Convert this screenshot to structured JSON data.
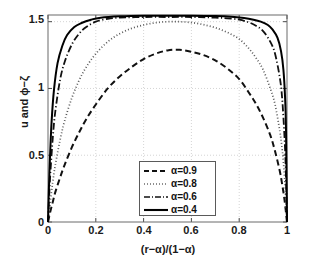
{
  "chart_data": {
    "type": "line",
    "title": "",
    "xlabel": "(r−α)/(1−α)",
    "ylabel": "u and ϕ−ζ",
    "xlim": [
      0,
      1
    ],
    "ylim": [
      0,
      1.55
    ],
    "grid": true,
    "xticks": [
      "0",
      "0.2",
      "0.4",
      "0.6",
      "0.8",
      "1"
    ],
    "xtick_values": [
      0,
      0.2,
      0.4,
      0.6,
      0.8,
      1
    ],
    "yticks": [
      "0",
      "0.5",
      "1",
      "1.5"
    ],
    "ytick_values": [
      0,
      0.5,
      1,
      1.5
    ],
    "legend_position": "lower center",
    "series": [
      {
        "name": "α=0.9",
        "style": "dashed",
        "color": "#111111",
        "peak": 1.29,
        "x": [
          0,
          0.01,
          0.02,
          0.03,
          0.05,
          0.07,
          0.1,
          0.13,
          0.16,
          0.2,
          0.25,
          0.3,
          0.35,
          0.4,
          0.45,
          0.5,
          0.55,
          0.6,
          0.65,
          0.7,
          0.75,
          0.8,
          0.84,
          0.87,
          0.9,
          0.93,
          0.95,
          0.97,
          0.98,
          0.99,
          1
        ],
        "y": [
          0,
          0.08,
          0.15,
          0.22,
          0.33,
          0.43,
          0.56,
          0.67,
          0.77,
          0.88,
          1.0,
          1.09,
          1.16,
          1.22,
          1.26,
          1.285,
          1.29,
          1.275,
          1.25,
          1.21,
          1.15,
          1.07,
          0.97,
          0.885,
          0.78,
          0.65,
          0.53,
          0.38,
          0.28,
          0.16,
          0
        ]
      },
      {
        "name": "α=0.8",
        "style": "dotted",
        "color": "#5a5a5a",
        "peak": 1.5,
        "x": [
          0,
          0.01,
          0.02,
          0.03,
          0.05,
          0.07,
          0.1,
          0.13,
          0.16,
          0.2,
          0.25,
          0.3,
          0.35,
          0.4,
          0.45,
          0.5,
          0.55,
          0.6,
          0.65,
          0.7,
          0.75,
          0.8,
          0.84,
          0.87,
          0.9,
          0.93,
          0.95,
          0.97,
          0.98,
          0.99,
          1
        ],
        "y": [
          0,
          0.16,
          0.3,
          0.42,
          0.61,
          0.76,
          0.93,
          1.06,
          1.16,
          1.26,
          1.35,
          1.41,
          1.45,
          1.475,
          1.492,
          1.5,
          1.5,
          1.493,
          1.478,
          1.455,
          1.42,
          1.37,
          1.3,
          1.23,
          1.14,
          1.0,
          0.88,
          0.68,
          0.54,
          0.33,
          0
        ]
      },
      {
        "name": "α=0.6",
        "style": "dashdot",
        "color": "#111111",
        "peak": 1.535,
        "x": [
          0,
          0.005,
          0.01,
          0.02,
          0.03,
          0.05,
          0.07,
          0.1,
          0.13,
          0.16,
          0.2,
          0.25,
          0.3,
          0.4,
          0.5,
          0.6,
          0.7,
          0.75,
          0.8,
          0.84,
          0.87,
          0.9,
          0.93,
          0.95,
          0.97,
          0.98,
          0.99,
          0.995,
          1
        ],
        "y": [
          0,
          0.2,
          0.37,
          0.63,
          0.82,
          1.06,
          1.2,
          1.33,
          1.41,
          1.46,
          1.5,
          1.522,
          1.53,
          1.535,
          1.535,
          1.535,
          1.53,
          1.525,
          1.515,
          1.495,
          1.47,
          1.43,
          1.35,
          1.26,
          1.08,
          0.92,
          0.62,
          0.38,
          0
        ]
      },
      {
        "name": "α=0.4",
        "style": "solid",
        "color": "#000000",
        "peak": 1.545,
        "x": [
          0,
          0.004,
          0.008,
          0.015,
          0.025,
          0.04,
          0.06,
          0.08,
          0.11,
          0.14,
          0.18,
          0.22,
          0.3,
          0.4,
          0.5,
          0.6,
          0.7,
          0.78,
          0.82,
          0.86,
          0.89,
          0.92,
          0.94,
          0.96,
          0.975,
          0.985,
          0.992,
          0.996,
          1
        ],
        "y": [
          0,
          0.26,
          0.47,
          0.75,
          0.99,
          1.19,
          1.32,
          1.4,
          1.46,
          1.49,
          1.515,
          1.53,
          1.54,
          1.545,
          1.545,
          1.545,
          1.542,
          1.535,
          1.528,
          1.515,
          1.5,
          1.475,
          1.44,
          1.38,
          1.28,
          1.14,
          0.93,
          0.68,
          0
        ]
      }
    ]
  },
  "legend": {
    "items": [
      {
        "label": "α=0.9",
        "style": "dashed"
      },
      {
        "label": "α=0.8",
        "style": "dotted"
      },
      {
        "label": "α=0.6",
        "style": "dashdot"
      },
      {
        "label": "α=0.4",
        "style": "solid"
      }
    ]
  }
}
